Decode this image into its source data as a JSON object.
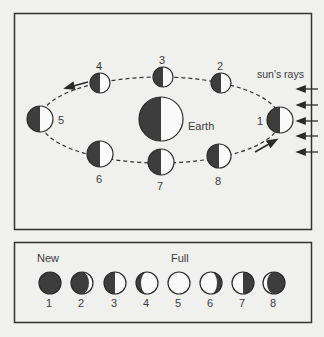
{
  "orbit_panel": {
    "earth_label": "Earth",
    "sun_label": "sun's rays",
    "moon_positions": [
      {
        "label": "1",
        "cx": 280,
        "cy": 120
      },
      {
        "label": "2",
        "cx": 221,
        "cy": 83
      },
      {
        "label": "3",
        "cx": 163,
        "cy": 77
      },
      {
        "label": "4",
        "cx": 100,
        "cy": 83
      },
      {
        "label": "5",
        "cx": 40,
        "cy": 119
      },
      {
        "label": "6",
        "cx": 100,
        "cy": 154
      },
      {
        "label": "7",
        "cx": 161,
        "cy": 162
      },
      {
        "label": "8",
        "cx": 219,
        "cy": 156
      }
    ]
  },
  "phase_panel": {
    "new_label": "New",
    "full_label": "Full",
    "phases": [
      {
        "label": "1",
        "name": "new"
      },
      {
        "label": "2",
        "name": "waxing-crescent"
      },
      {
        "label": "3",
        "name": "first-quarter"
      },
      {
        "label": "4",
        "name": "waxing-gibbous"
      },
      {
        "label": "5",
        "name": "full"
      },
      {
        "label": "6",
        "name": "waning-gibbous"
      },
      {
        "label": "7",
        "name": "last-quarter"
      },
      {
        "label": "8",
        "name": "waning-crescent"
      }
    ]
  },
  "colors": {
    "dark": "#3d3d3d",
    "light": "#fafafa",
    "stroke": "#2a2a2a",
    "background": "#f0f0ee"
  }
}
